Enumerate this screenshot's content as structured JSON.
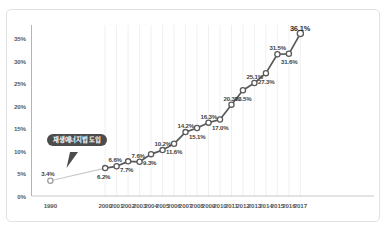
{
  "chart_data": {
    "type": "line",
    "title": "",
    "subtitle": "",
    "xlabel": "",
    "ylabel": "",
    "grid": "vertical-only",
    "legend": "none",
    "ylim": [
      0,
      38
    ],
    "ytick_labels": [
      "0%",
      "5%",
      "10%",
      "15%",
      "20%",
      "25%",
      "30%",
      "35%"
    ],
    "ytick_values": [
      0,
      5,
      10,
      15,
      20,
      25,
      30,
      35
    ],
    "categories": [
      "1990",
      "2000",
      "2001",
      "2002",
      "2003",
      "2004",
      "2005",
      "2006",
      "2007",
      "2008",
      "2009",
      "2010",
      "2011",
      "2012",
      "2013",
      "2014",
      "2015",
      "2016",
      "2017"
    ],
    "values": [
      3.4,
      6.2,
      6.6,
      7.7,
      7.6,
      9.3,
      10.2,
      11.6,
      14.2,
      15.1,
      16.3,
      17.0,
      20.3,
      23.5,
      25.1,
      27.3,
      31.5,
      31.6,
      36.1
    ],
    "point_labels": [
      "3.4%",
      "6.2%",
      "6.6%",
      "7.7%",
      "7.6%",
      "9.3%",
      "10.2%",
      "11.6%",
      "14.2%",
      "15.1%",
      "16.3%",
      "17.0%",
      "20.3%",
      "23.5%",
      "25.1%",
      "27.3%",
      "31.5%",
      "31.6%",
      "36.1%"
    ],
    "annotations": [
      {
        "text": "재생에너지법 도입",
        "points_to_category": "2000",
        "style": "speech-bubble",
        "color": "#4c4c4c"
      }
    ],
    "series_color": "#595959",
    "marker_fill": "#ffffff",
    "marker_edge": "#595959",
    "leading_segment_style": "light-gray"
  },
  "colors": {
    "line": "#595959",
    "marker_fill": "#ffffff",
    "marker_edge": "#5b5b5b",
    "axis": "#b4b4b4",
    "gridline": "#ececec",
    "frame_border": "#e2e2e2",
    "tick_text": "#5a5a5a",
    "label_text": "#3f3f3f",
    "callout_bg": "#4c4c4c",
    "callout_text": "#ffffff",
    "background": "#ffffff"
  }
}
